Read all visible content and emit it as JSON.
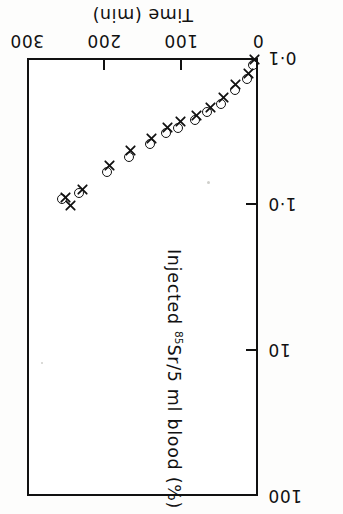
{
  "chart_data": {
    "type": "scatter",
    "title": "",
    "xlabel": "Time (min)",
    "ylabel": "Injected 85Sr/5 ml blood (%)",
    "ylabel_parts": {
      "pre": "Injected ",
      "sup": "85",
      "post": "Sr/5 ml blood (%)"
    },
    "orientation": "rotated-180",
    "xlim": [
      0,
      300
    ],
    "xticks": [
      0,
      100,
      200,
      300
    ],
    "xticklabels": [
      "0",
      "100",
      "200",
      "300"
    ],
    "x_axis_position": "top",
    "x_direction": "right-to-left",
    "yscale": "log",
    "ylim": [
      0.1,
      100
    ],
    "yticks": [
      0.1,
      1.0,
      10,
      100
    ],
    "yticklabels": [
      "0·1",
      "1·0",
      "10",
      "100"
    ],
    "y_axis_position": "right",
    "y_direction": "increasing-downward",
    "grid": false,
    "legend": "none",
    "series": [
      {
        "name": "circles",
        "marker": "circle",
        "points": [
          {
            "x": 6,
            "y": 0.112
          },
          {
            "x": 14,
            "y": 0.14
          },
          {
            "x": 30,
            "y": 0.165
          },
          {
            "x": 48,
            "y": 0.205
          },
          {
            "x": 66,
            "y": 0.235
          },
          {
            "x": 82,
            "y": 0.265
          },
          {
            "x": 104,
            "y": 0.3
          },
          {
            "x": 120,
            "y": 0.325
          },
          {
            "x": 140,
            "y": 0.39
          },
          {
            "x": 168,
            "y": 0.48
          },
          {
            "x": 196,
            "y": 0.6
          },
          {
            "x": 232,
            "y": 0.84
          },
          {
            "x": 255,
            "y": 0.93
          }
        ]
      },
      {
        "name": "crosses",
        "marker": "cross",
        "points": [
          {
            "x": 4,
            "y": 0.102
          },
          {
            "x": 12,
            "y": 0.128
          },
          {
            "x": 29,
            "y": 0.152
          },
          {
            "x": 45,
            "y": 0.185
          },
          {
            "x": 62,
            "y": 0.218
          },
          {
            "x": 80,
            "y": 0.248
          },
          {
            "x": 101,
            "y": 0.272
          },
          {
            "x": 118,
            "y": 0.3
          },
          {
            "x": 138,
            "y": 0.355
          },
          {
            "x": 166,
            "y": 0.43
          },
          {
            "x": 193,
            "y": 0.545
          },
          {
            "x": 228,
            "y": 0.79
          },
          {
            "x": 250,
            "y": 0.905
          },
          {
            "x": 244,
            "y": 1.03
          }
        ]
      }
    ]
  }
}
